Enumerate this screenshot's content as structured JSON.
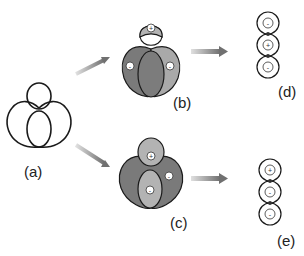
{
  "figure": {
    "panels": [
      {
        "id": "a",
        "label": "(a)",
        "description": "knot/link curve outline"
      },
      {
        "id": "b",
        "label": "(b)",
        "regions": [
          {
            "sign": "+",
            "color": "#b3b3b3"
          },
          {
            "sign": "-",
            "color": "#7a7a7a"
          },
          {
            "sign": "-",
            "color": "#a9a9a9"
          }
        ]
      },
      {
        "id": "c",
        "label": "(c)",
        "regions": [
          {
            "sign": "+",
            "color": "#b3b3b3"
          },
          {
            "sign": "-",
            "color": "#b3b3b3"
          },
          {
            "sign": "-",
            "color": "#7a7a7a"
          }
        ]
      },
      {
        "id": "d",
        "label": "(d)",
        "chain": [
          "-",
          "+",
          "-"
        ]
      },
      {
        "id": "e",
        "label": "(e)",
        "chain": [
          "+",
          "-",
          "-"
        ]
      }
    ],
    "colors": {
      "dark": "#7a7a7a",
      "light": "#b3b3b3",
      "line": "#1a1a1a",
      "arrow": "#8a8a8a"
    }
  }
}
